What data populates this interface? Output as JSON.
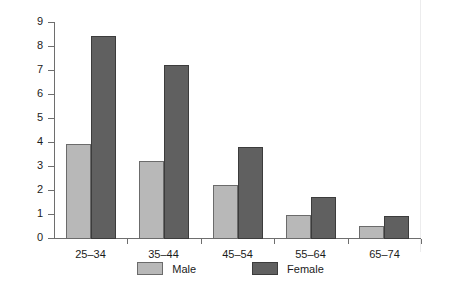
{
  "chart_data": {
    "type": "bar",
    "title": "",
    "subtitle": "",
    "xlabel": "",
    "ylabel": "",
    "categories": [
      "25–34",
      "35–44",
      "45–54",
      "55–64",
      "65–74"
    ],
    "series": [
      {
        "name": "Male",
        "color": "#b8b8b8",
        "values": [
          3.9,
          3.2,
          2.2,
          0.95,
          0.5
        ]
      },
      {
        "name": "Female",
        "color": "#606060",
        "values": [
          8.4,
          7.2,
          3.8,
          1.7,
          0.9
        ]
      }
    ],
    "ylim": [
      0,
      9
    ],
    "y_ticks": [
      0,
      1,
      2,
      3,
      4,
      5,
      6,
      7,
      8,
      9
    ],
    "y_tick_labels": [
      "0",
      "1",
      "2",
      "3",
      "4",
      "5",
      "6",
      "7",
      "8",
      "9"
    ],
    "grid": false,
    "legend_position": "bottom-center",
    "axis_color": "#6e6e6e"
  }
}
